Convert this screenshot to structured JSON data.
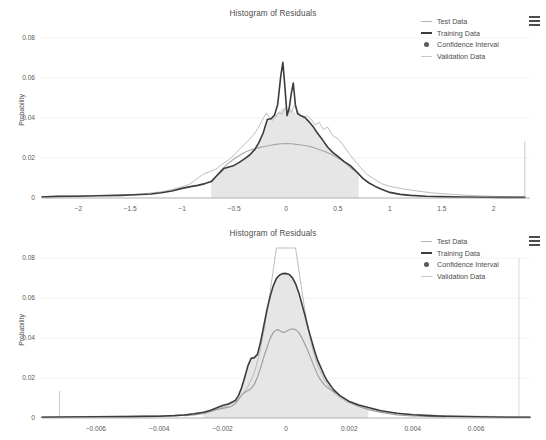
{
  "page": {
    "background": "#ffffff",
    "width": 546,
    "height": 440
  },
  "colors": {
    "training": "#3c3c3c",
    "test": "#b4b4b4",
    "validation": "#c8c8c8",
    "confidence_fill": "#e6e6e6",
    "confidence_marker": "#5a5a5a",
    "axis": "#9a9a9a",
    "grid": "#f0f0f0",
    "text": "#4d4d4d"
  },
  "legend": {
    "menu_icon": "hamburger-menu-icon",
    "items": [
      {
        "label": "Test Data",
        "marker": "line-thin",
        "color": "#b4b4b4"
      },
      {
        "label": "Training Data",
        "marker": "line-thick",
        "color": "#3c3c3c"
      },
      {
        "label": "Confidence Interval",
        "marker": "dot",
        "color": "#5a5a5a"
      },
      {
        "label": "Validation Data",
        "marker": "line-thin",
        "color": "#c8c8c8"
      }
    ]
  },
  "panels": [
    {
      "id": "panel-top",
      "title": "Histogram of Residuals",
      "ylabel": "Probability",
      "yticks": [
        "0",
        "0.02",
        "0.04",
        "0.06",
        "0.08"
      ],
      "xticks": [
        "-2",
        "-1.5",
        "-1",
        "-0.5",
        "0",
        "0.5",
        "1",
        "1.5",
        "2"
      ]
    },
    {
      "id": "panel-bottom",
      "title": "Histogram of Residuals",
      "ylabel": "Probability",
      "yticks": [
        "0",
        "0.02",
        "0.04",
        "0.06",
        "0.08"
      ],
      "xticks": [
        "-0.006",
        "-0.004",
        "-0.002",
        "0",
        "0.002",
        "0.004",
        "0.006"
      ]
    }
  ],
  "chart_data": [
    {
      "type": "line",
      "id": "panel-top",
      "title": "Histogram of Residuals",
      "xlabel": "",
      "ylabel": "Probability",
      "xlim": [
        -2.35,
        2.35
      ],
      "ylim": [
        0,
        0.085
      ],
      "xticks": [
        -2,
        -1.5,
        -1,
        -0.5,
        0,
        0.5,
        1,
        1.5,
        2
      ],
      "yticks": [
        0,
        0.02,
        0.04,
        0.06,
        0.08
      ],
      "grid": "horizontal",
      "legend_position": "top-right",
      "confidence_interval": {
        "x_start": -0.72,
        "x_end": 0.7,
        "fill": "#e6e6e6"
      },
      "annotations": [
        {
          "type": "vertical-line",
          "x": 2.3,
          "y_top": 0.0285,
          "color": "#c8c8c8"
        }
      ],
      "series": [
        {
          "name": "Training Data",
          "color": "#3c3c3c",
          "width": 1.6,
          "x": [
            -2.35,
            -2.2,
            -2.0,
            -1.8,
            -1.6,
            -1.45,
            -1.3,
            -1.2,
            -1.1,
            -1.0,
            -0.92,
            -0.85,
            -0.78,
            -0.72,
            -0.66,
            -0.6,
            -0.55,
            -0.5,
            -0.45,
            -0.4,
            -0.35,
            -0.3,
            -0.26,
            -0.22,
            -0.18,
            -0.14,
            -0.11,
            -0.08,
            -0.05,
            -0.03,
            -0.01,
            0.01,
            0.03,
            0.05,
            0.07,
            0.09,
            0.11,
            0.14,
            0.18,
            0.22,
            0.26,
            0.3,
            0.35,
            0.4,
            0.45,
            0.5,
            0.56,
            0.62,
            0.68,
            0.74,
            0.8,
            0.86,
            0.92,
            1.0,
            1.1,
            1.2,
            1.35,
            1.5,
            1.7,
            1.9,
            2.1,
            2.3
          ],
          "y": [
            0.0005,
            0.0008,
            0.0009,
            0.0011,
            0.0013,
            0.0016,
            0.002,
            0.0026,
            0.0035,
            0.0048,
            0.0057,
            0.0063,
            0.0072,
            0.0082,
            0.0115,
            0.0147,
            0.0155,
            0.0163,
            0.0178,
            0.0196,
            0.0215,
            0.0243,
            0.0278,
            0.0325,
            0.0392,
            0.0398,
            0.0415,
            0.0468,
            0.0612,
            0.0678,
            0.0552,
            0.0412,
            0.0446,
            0.0519,
            0.0575,
            0.0468,
            0.0423,
            0.0412,
            0.0404,
            0.0382,
            0.0358,
            0.0326,
            0.0292,
            0.0255,
            0.0228,
            0.0208,
            0.0182,
            0.0162,
            0.0131,
            0.0098,
            0.0075,
            0.0058,
            0.0044,
            0.0028,
            0.0018,
            0.0013,
            0.0009,
            0.0007,
            0.0005,
            0.0004,
            0.0003,
            0.0003
          ]
        },
        {
          "name": "Test Data",
          "color": "#b4b4b4",
          "width": 0.9,
          "x": [
            -2.35,
            -2.1,
            -1.9,
            -1.7,
            -1.5,
            -1.35,
            -1.2,
            -1.1,
            -1.0,
            -0.93,
            -0.86,
            -0.8,
            -0.74,
            -0.68,
            -0.62,
            -0.56,
            -0.5,
            -0.45,
            -0.4,
            -0.35,
            -0.31,
            -0.27,
            -0.23,
            -0.19,
            -0.16,
            -0.13,
            -0.1,
            -0.07,
            -0.04,
            -0.01,
            0.02,
            0.05,
            0.08,
            0.11,
            0.14,
            0.17,
            0.2,
            0.24,
            0.28,
            0.32,
            0.36,
            0.4,
            0.45,
            0.5,
            0.55,
            0.6,
            0.66,
            0.72,
            0.78,
            0.85,
            0.92,
            1.0,
            1.1,
            1.25,
            1.4,
            1.6,
            1.8,
            2.0,
            2.2,
            2.3
          ],
          "y": [
            0.0008,
            0.001,
            0.0012,
            0.0014,
            0.0017,
            0.0022,
            0.0031,
            0.0042,
            0.0056,
            0.0068,
            0.0095,
            0.0118,
            0.0131,
            0.0143,
            0.0167,
            0.0188,
            0.0214,
            0.0243,
            0.0268,
            0.0295,
            0.0318,
            0.0348,
            0.0388,
            0.0424,
            0.0402,
            0.0388,
            0.0404,
            0.0428,
            0.0418,
            0.0451,
            0.0438,
            0.0428,
            0.0462,
            0.0438,
            0.0412,
            0.0398,
            0.0412,
            0.0396,
            0.0364,
            0.0378,
            0.0342,
            0.0355,
            0.0312,
            0.0296,
            0.0264,
            0.0228,
            0.0188,
            0.0151,
            0.0118,
            0.0094,
            0.0072,
            0.0058,
            0.0048,
            0.0036,
            0.0026,
            0.0018,
            0.0012,
            0.0008,
            0.0006,
            0.0005
          ]
        },
        {
          "name": "Validation Data",
          "color": "#a8a8a8",
          "width": 1.1,
          "x": [
            -0.72,
            -0.68,
            -0.62,
            -0.56,
            -0.5,
            -0.44,
            -0.38,
            -0.32,
            -0.26,
            -0.2,
            -0.15,
            -0.1,
            -0.05,
            0.0,
            0.05,
            0.1,
            0.15,
            0.2,
            0.26,
            0.32,
            0.38,
            0.44,
            0.5,
            0.56,
            0.62,
            0.68,
            0.7
          ],
          "y": [
            0.0082,
            0.0105,
            0.0142,
            0.0172,
            0.0196,
            0.0215,
            0.0232,
            0.0244,
            0.0252,
            0.0259,
            0.0264,
            0.0268,
            0.0271,
            0.0272,
            0.0271,
            0.0268,
            0.0265,
            0.0261,
            0.0253,
            0.0243,
            0.0231,
            0.0217,
            0.02,
            0.0181,
            0.0152,
            0.0128,
            0.0122
          ]
        },
        {
          "name": "Confidence Interval Band",
          "color": "#e6e6e6",
          "type": "area",
          "x": [
            -0.72,
            -0.66,
            -0.6,
            -0.55,
            -0.5,
            -0.45,
            -0.4,
            -0.35,
            -0.3,
            -0.26,
            -0.22,
            -0.18,
            -0.14,
            -0.11,
            -0.08,
            -0.05,
            -0.03,
            -0.01,
            0.01,
            0.03,
            0.05,
            0.07,
            0.09,
            0.11,
            0.14,
            0.18,
            0.22,
            0.26,
            0.3,
            0.35,
            0.4,
            0.45,
            0.5,
            0.56,
            0.62,
            0.68,
            0.7
          ],
          "y": [
            0.0082,
            0.0115,
            0.0147,
            0.0155,
            0.0163,
            0.0178,
            0.0196,
            0.0215,
            0.0243,
            0.0278,
            0.0325,
            0.0392,
            0.0398,
            0.0415,
            0.0428,
            0.0441,
            0.0452,
            0.0441,
            0.0412,
            0.0435,
            0.0448,
            0.0436,
            0.0421,
            0.0423,
            0.0412,
            0.0404,
            0.0382,
            0.0358,
            0.0326,
            0.0292,
            0.0255,
            0.0228,
            0.0208,
            0.0182,
            0.0162,
            0.0131,
            0.0125
          ]
        }
      ]
    },
    {
      "type": "line",
      "id": "panel-bottom",
      "title": "Histogram of Residuals",
      "xlabel": "",
      "ylabel": "Probability",
      "xlim": [
        -0.0077,
        0.0077
      ],
      "ylim": [
        0,
        0.085
      ],
      "xticks": [
        -0.006,
        -0.004,
        -0.002,
        0,
        0.002,
        0.004,
        0.006
      ],
      "yticks": [
        0,
        0.02,
        0.04,
        0.06,
        0.08
      ],
      "grid": "horizontal",
      "legend_position": "top-right",
      "confidence_interval": {
        "x_start": -0.0026,
        "x_end": 0.0026,
        "fill": "#e6e6e6"
      },
      "annotations": [
        {
          "type": "vertical-line",
          "x": -0.00715,
          "y_top": 0.0135,
          "color": "#c8c8c8"
        },
        {
          "type": "vertical-line",
          "x": 0.00735,
          "y_top": 0.08,
          "color": "#d8d8d8"
        }
      ],
      "series": [
        {
          "name": "Training Data",
          "color": "#3c3c3c",
          "width": 1.6,
          "x": [
            -0.0077,
            -0.007,
            -0.006,
            -0.005,
            -0.0045,
            -0.004,
            -0.0035,
            -0.0032,
            -0.0029,
            -0.0026,
            -0.0024,
            -0.0022,
            -0.002,
            -0.0018,
            -0.0016,
            -0.0015,
            -0.0014,
            -0.0013,
            -0.0012,
            -0.0011,
            -0.001,
            -0.0009,
            -0.0008,
            -0.0007,
            -0.0006,
            -0.0005,
            -0.0004,
            -0.0003,
            -0.0002,
            -0.0001,
            0.0,
            0.0001,
            0.0002,
            0.0003,
            0.0004,
            0.0005,
            0.0006,
            0.0007,
            0.0008,
            0.0009,
            0.001,
            0.0011,
            0.0012,
            0.0013,
            0.0015,
            0.0017,
            0.002,
            0.0023,
            0.0026,
            0.003,
            0.0035,
            0.004,
            0.0045,
            0.005,
            0.006,
            0.007,
            0.0077
          ],
          "y": [
            0.0004,
            0.0005,
            0.0006,
            0.0007,
            0.0008,
            0.0009,
            0.0012,
            0.0015,
            0.0021,
            0.0029,
            0.0038,
            0.005,
            0.0062,
            0.0071,
            0.0088,
            0.0112,
            0.0152,
            0.0205,
            0.0262,
            0.0298,
            0.0302,
            0.0318,
            0.0382,
            0.0462,
            0.0542,
            0.0608,
            0.0662,
            0.0698,
            0.0715,
            0.0722,
            0.0723,
            0.0718,
            0.0702,
            0.0672,
            0.0628,
            0.0572,
            0.0512,
            0.0448,
            0.0392,
            0.0336,
            0.0288,
            0.0252,
            0.0216,
            0.0186,
            0.0142,
            0.0112,
            0.0082,
            0.0065,
            0.0052,
            0.0036,
            0.0024,
            0.0016,
            0.0012,
            0.0009,
            0.0006,
            0.0004,
            0.0004
          ]
        },
        {
          "name": "Test Data",
          "color": "#b4b4b4",
          "width": 0.9,
          "x": [
            -0.0077,
            -0.007,
            -0.006,
            -0.005,
            -0.004,
            -0.0035,
            -0.003,
            -0.0026,
            -0.0022,
            -0.0019,
            -0.0016,
            -0.0014,
            -0.0012,
            -0.001,
            -0.0009,
            -0.0008,
            -0.0007,
            -0.0006,
            -0.0005,
            -0.0004,
            -0.00035,
            -0.0003,
            0.0,
            0.0003,
            0.00035,
            0.0004,
            0.0005,
            0.0006,
            0.0007,
            0.0008,
            0.0009,
            0.001,
            0.0012,
            0.0014,
            0.0016,
            0.0019,
            0.0022,
            0.0026,
            0.003,
            0.0035,
            0.004,
            0.005,
            0.006,
            0.007,
            0.0077
          ],
          "y": [
            0.0006,
            0.0007,
            0.0008,
            0.0009,
            0.0011,
            0.0014,
            0.002,
            0.0028,
            0.0042,
            0.0058,
            0.0082,
            0.0112,
            0.0158,
            0.0225,
            0.0285,
            0.0352,
            0.0432,
            0.0528,
            0.0632,
            0.0742,
            0.08,
            0.088,
            0.096,
            0.088,
            0.08,
            0.0745,
            0.0638,
            0.0535,
            0.0448,
            0.0372,
            0.0312,
            0.0262,
            0.0192,
            0.0145,
            0.0112,
            0.0082,
            0.0062,
            0.0046,
            0.0034,
            0.0024,
            0.0018,
            0.0012,
            0.0009,
            0.0007,
            0.0006
          ]
        },
        {
          "name": "Validation Data",
          "color": "#a0a0a0",
          "width": 1.2,
          "x": [
            -0.0032,
            -0.0029,
            -0.0026,
            -0.0024,
            -0.0022,
            -0.002,
            -0.0018,
            -0.0017,
            -0.0016,
            -0.0015,
            -0.0014,
            -0.0013,
            -0.0012,
            -0.0011,
            -0.001,
            -0.0009,
            -0.0008,
            -0.0007,
            -0.0006,
            -0.0005,
            -0.0004,
            -0.0003,
            -0.0002,
            -0.0001,
            0.0,
            0.0001,
            0.0002,
            0.0003,
            0.0004,
            0.0005,
            0.0006,
            0.0007,
            0.0008,
            0.0009,
            0.001,
            0.0011,
            0.0012,
            0.0013,
            0.0015,
            0.0017,
            0.002,
            0.0023,
            0.0026,
            0.003,
            0.0035,
            0.004,
            0.005
          ],
          "y": [
            0.0012,
            0.0016,
            0.0022,
            0.0032,
            0.0042,
            0.0048,
            0.0054,
            0.006,
            0.0072,
            0.0092,
            0.0115,
            0.0128,
            0.0138,
            0.0148,
            0.0168,
            0.0205,
            0.0252,
            0.0305,
            0.0352,
            0.0398,
            0.0428,
            0.0442,
            0.0438,
            0.0428,
            0.0432,
            0.0441,
            0.0446,
            0.0442,
            0.0428,
            0.0402,
            0.0368,
            0.0332,
            0.0292,
            0.0252,
            0.0215,
            0.0188,
            0.0168,
            0.0152,
            0.0132,
            0.0112,
            0.0082,
            0.0058,
            0.0042,
            0.0028,
            0.0016,
            0.001,
            0.0006
          ]
        },
        {
          "name": "Confidence Interval Band",
          "color": "#e6e6e6",
          "type": "area",
          "x": [
            -0.0026,
            -0.0024,
            -0.0022,
            -0.002,
            -0.0018,
            -0.0016,
            -0.0015,
            -0.0014,
            -0.0013,
            -0.0012,
            -0.0011,
            -0.001,
            -0.0009,
            -0.0008,
            -0.0007,
            -0.0006,
            -0.0005,
            -0.0004,
            -0.0003,
            -0.0002,
            -0.0001,
            0.0,
            0.0001,
            0.0002,
            0.0003,
            0.0004,
            0.0005,
            0.0006,
            0.0007,
            0.0008,
            0.0009,
            0.001,
            0.0011,
            0.0012,
            0.0013,
            0.0015,
            0.0017,
            0.002,
            0.0023,
            0.0026
          ],
          "y": [
            0.0029,
            0.0038,
            0.005,
            0.0062,
            0.0071,
            0.0088,
            0.0112,
            0.0152,
            0.0205,
            0.0262,
            0.0298,
            0.0302,
            0.0318,
            0.0382,
            0.0462,
            0.0542,
            0.0608,
            0.0662,
            0.0698,
            0.0715,
            0.0722,
            0.0723,
            0.0718,
            0.0702,
            0.0672,
            0.0628,
            0.0572,
            0.0512,
            0.0448,
            0.0392,
            0.0336,
            0.0288,
            0.0252,
            0.0216,
            0.0186,
            0.0142,
            0.0112,
            0.0082,
            0.0065,
            0.0052
          ]
        }
      ]
    }
  ]
}
